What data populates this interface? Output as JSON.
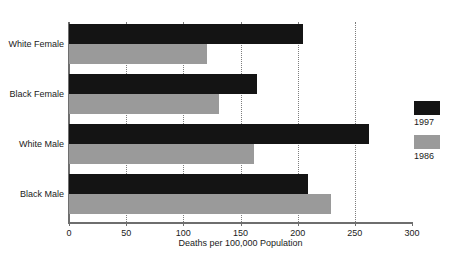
{
  "title_remnant": "",
  "chart_data": {
    "type": "bar",
    "orientation": "horizontal",
    "title": "",
    "xlabel": "Deaths per 100,000 Population",
    "ylabel": "",
    "xlim": [
      0,
      300
    ],
    "xticks": [
      0,
      50,
      100,
      150,
      200,
      250,
      300
    ],
    "xtick_labels": [
      "0",
      "50",
      "100",
      "150",
      "200",
      "250",
      "300"
    ],
    "grid": "vertical-dotted",
    "legend_position": "right",
    "categories": [
      "White Female",
      "Black Female",
      "White Male",
      "Black Male"
    ],
    "series": [
      {
        "name": "1997",
        "color": "#141414",
        "values": [
          205,
          164,
          262,
          209
        ]
      },
      {
        "name": "1986",
        "color": "#9a9a9a",
        "values": [
          121,
          131,
          162,
          229
        ]
      }
    ]
  },
  "legend": {
    "entries": [
      {
        "label": "1997",
        "swatch": "black-swatch"
      },
      {
        "label": "1986",
        "swatch": "gray-swatch"
      }
    ]
  },
  "colors": {
    "series_1997": "#141414",
    "series_1986": "#9a9a9a",
    "axis": "#6e6e6e",
    "grid": "#7d7d7d",
    "background": "#ffffff",
    "text": "#1a1a1a"
  }
}
